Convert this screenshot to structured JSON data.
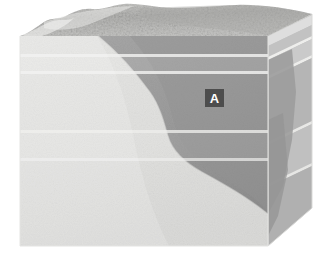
{
  "figure": {
    "kind": "geologic-block-diagram",
    "background_color": "#ffffff",
    "width": 335,
    "height": 276
  },
  "labels": [
    {
      "id": "A",
      "text": "A",
      "x": 205,
      "y": 89,
      "width": 19,
      "height": 18,
      "box_color": "#4d4d4d",
      "text_color": "#ffffff"
    }
  ],
  "units": {
    "top_surface": {
      "name": "eroded-land-surface",
      "color": "#b9b9b9",
      "texture": "stippled"
    },
    "light_unit": {
      "name": "light-gray-rock-unit",
      "color": "#e2e2e0"
    },
    "dark_unit": {
      "name": "dark-gray-rock-unit",
      "color": "#9b9b9b"
    },
    "right_face": {
      "name": "right-side-face",
      "color": "#c9c9c7"
    }
  },
  "strata_lines": {
    "name": "bedding-contacts",
    "color": "#efefed",
    "front_face_y": [
      55,
      72,
      131,
      159
    ],
    "count": 4
  },
  "contact": {
    "name": "inclined-contact",
    "description": "S-shaped contact separating the light unit from the dark unit"
  }
}
